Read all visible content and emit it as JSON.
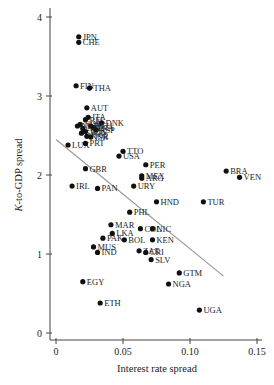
{
  "chart_data": {
    "type": "scatter",
    "title": "",
    "xlabel": "Interest rate spread",
    "ylabel": "K-to-GDP spread",
    "xlim": [
      -0.004,
      0.152
    ],
    "ylim": [
      -0.05,
      4.1
    ],
    "xticks": [
      0,
      0.05,
      0.1,
      0.15
    ],
    "xtick_labels": [
      "0",
      "0.05",
      "0.10",
      "0.15"
    ],
    "yticks": [
      0,
      1,
      2,
      3,
      4
    ],
    "ytick_labels": [
      "0",
      "1",
      "2",
      "3",
      "4"
    ],
    "grid": false,
    "legend": null,
    "trendline": {
      "x0": 0.0,
      "y0": 2.45,
      "x1": 0.125,
      "y1": 0.72,
      "color": "#999999"
    },
    "points": [
      {
        "label": "JPN",
        "x": 0.017,
        "y": 3.75
      },
      {
        "label": "CHE",
        "x": 0.017,
        "y": 3.68
      },
      {
        "label": "FIN",
        "x": 0.015,
        "y": 3.13
      },
      {
        "label": "THA",
        "x": 0.025,
        "y": 3.1
      },
      {
        "label": "AUT",
        "x": 0.023,
        "y": 2.85
      },
      {
        "label": "ITA",
        "x": 0.024,
        "y": 2.73
      },
      {
        "label": "BEL",
        "x": 0.022,
        "y": 2.7
      },
      {
        "label": "DNK",
        "x": 0.034,
        "y": 2.66
      },
      {
        "label": "NOR",
        "x": 0.018,
        "y": 2.64
      },
      {
        "label": "DEU",
        "x": 0.026,
        "y": 2.62
      },
      {
        "label": "FRA",
        "x": 0.028,
        "y": 2.6
      },
      {
        "label": "NZL",
        "x": 0.02,
        "y": 2.59
      },
      {
        "label": "ESP",
        "x": 0.03,
        "y": 2.57
      },
      {
        "label": "NLD",
        "x": 0.016,
        "y": 2.62
      },
      {
        "label": "AUS",
        "x": 0.022,
        "y": 2.55
      },
      {
        "label": "SWE",
        "x": 0.019,
        "y": 2.53
      },
      {
        "label": "ISR",
        "x": 0.026,
        "y": 2.48
      },
      {
        "label": "KOR",
        "x": 0.023,
        "y": 2.49
      },
      {
        "label": "LUX",
        "x": 0.009,
        "y": 2.38
      },
      {
        "label": "PRT",
        "x": 0.022,
        "y": 2.4
      },
      {
        "label": "TTO",
        "x": 0.05,
        "y": 2.3
      },
      {
        "label": "USA",
        "x": 0.047,
        "y": 2.24
      },
      {
        "label": "GBR",
        "x": 0.022,
        "y": 2.08
      },
      {
        "label": "PER",
        "x": 0.067,
        "y": 2.13
      },
      {
        "label": "MEX",
        "x": 0.064,
        "y": 1.99
      },
      {
        "label": "ARG",
        "x": 0.064,
        "y": 1.96
      },
      {
        "label": "BRA",
        "x": 0.127,
        "y": 2.05
      },
      {
        "label": "VEN",
        "x": 0.137,
        "y": 1.97
      },
      {
        "label": "IRL",
        "x": 0.012,
        "y": 1.86
      },
      {
        "label": "PAN",
        "x": 0.031,
        "y": 1.83
      },
      {
        "label": "URY",
        "x": 0.058,
        "y": 1.86
      },
      {
        "label": "HND",
        "x": 0.075,
        "y": 1.66
      },
      {
        "label": "TUR",
        "x": 0.11,
        "y": 1.66
      },
      {
        "label": "PHL",
        "x": 0.055,
        "y": 1.53
      },
      {
        "label": "MAR",
        "x": 0.041,
        "y": 1.37
      },
      {
        "label": "COL",
        "x": 0.063,
        "y": 1.32
      },
      {
        "label": "NIC",
        "x": 0.072,
        "y": 1.32
      },
      {
        "label": "LKA",
        "x": 0.042,
        "y": 1.26
      },
      {
        "label": "PAK",
        "x": 0.035,
        "y": 1.2
      },
      {
        "label": "BOL",
        "x": 0.051,
        "y": 1.18
      },
      {
        "label": "KEN",
        "x": 0.072,
        "y": 1.18
      },
      {
        "label": "MUS",
        "x": 0.028,
        "y": 1.09
      },
      {
        "label": "ZAE",
        "x": 0.062,
        "y": 1.04
      },
      {
        "label": "CRI",
        "x": 0.067,
        "y": 1.02
      },
      {
        "label": "IND",
        "x": 0.031,
        "y": 1.02
      },
      {
        "label": "SLV",
        "x": 0.071,
        "y": 0.93
      },
      {
        "label": "GTM",
        "x": 0.092,
        "y": 0.76
      },
      {
        "label": "NGA",
        "x": 0.084,
        "y": 0.62
      },
      {
        "label": "EGY",
        "x": 0.02,
        "y": 0.65
      },
      {
        "label": "ETH",
        "x": 0.033,
        "y": 0.38
      },
      {
        "label": "UGA",
        "x": 0.107,
        "y": 0.29
      }
    ]
  }
}
